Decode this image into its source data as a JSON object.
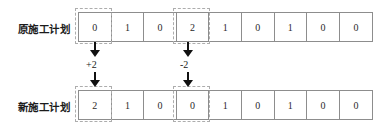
{
  "diagram": {
    "rows": [
      {
        "key": "original",
        "label": "原施工计划",
        "values": [
          "0",
          "1",
          "0",
          "2",
          "1",
          "0",
          "1",
          "0",
          "0"
        ],
        "highlighted_indices": [
          0,
          3
        ]
      },
      {
        "key": "new",
        "label": "新施工计划",
        "values": [
          "2",
          "1",
          "0",
          "0",
          "1",
          "0",
          "1",
          "0",
          "0"
        ],
        "highlighted_indices": [
          0,
          3
        ]
      }
    ],
    "annotations": [
      {
        "key": "left",
        "label": "+2",
        "column": 0
      },
      {
        "key": "right",
        "label": "-2",
        "column": 3
      }
    ],
    "colors": {
      "cell_border": "#8d8d8d",
      "highlight_border": "#adadad",
      "arrow": "#111111",
      "text": "#1b1b1b",
      "background": "#ffffff"
    }
  }
}
